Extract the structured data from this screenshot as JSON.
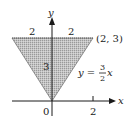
{
  "diagram": {
    "axes": {
      "x_label": "x",
      "y_label": "y",
      "origin_label": "0",
      "x_tick_label": "2"
    },
    "region": {
      "shape": "triangle",
      "vertices": [
        [
          -2,
          3
        ],
        [
          2,
          3
        ],
        [
          0,
          0
        ]
      ],
      "fill": "#bdbdbd",
      "pattern": "stippled"
    },
    "labels": {
      "top_left_width": "2",
      "top_right_width": "2",
      "height": "3",
      "vertex": "(2, 3)",
      "line_eq_prefix": "y =",
      "line_eq_num": "3",
      "line_eq_den": "2",
      "line_eq_var": "x"
    },
    "colors": {
      "ink": "#1a1a1a",
      "shade": "#bdbdbd",
      "background": "#ffffff"
    }
  }
}
